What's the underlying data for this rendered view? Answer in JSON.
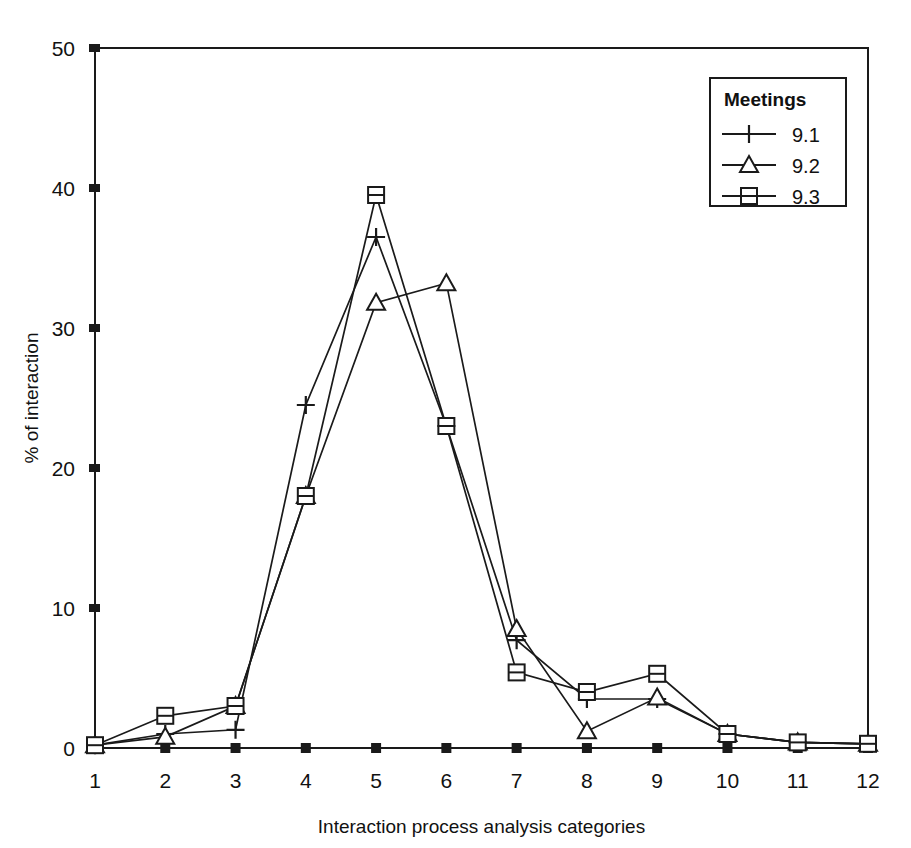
{
  "chart_data": {
    "type": "line",
    "title": "",
    "xlabel": "Interaction process analysis categories",
    "ylabel": "% of interaction",
    "categories": [
      1,
      2,
      3,
      4,
      5,
      6,
      7,
      8,
      9,
      10,
      11,
      12
    ],
    "xtick_labels": [
      "1",
      "2",
      "3",
      "4",
      "5",
      "6",
      "7",
      "8",
      "9",
      "10",
      "11",
      "12"
    ],
    "ytick_labels": [
      "0",
      "10",
      "20",
      "30",
      "40",
      "50"
    ],
    "yticks": [
      0,
      10,
      20,
      30,
      40,
      50
    ],
    "ylim": [
      0,
      50
    ],
    "xlim": [
      1,
      12
    ],
    "grid": false,
    "legend_position": "top-right",
    "legend_title": "Meetings",
    "series": [
      {
        "name": "9.1",
        "marker": "plus",
        "values": [
          0.2,
          1.0,
          1.3,
          24.5,
          36.5,
          23.0,
          7.7,
          3.5,
          3.5,
          1.0,
          0.4,
          0.3
        ]
      },
      {
        "name": "9.2",
        "marker": "triangle",
        "values": [
          0.2,
          0.8,
          3.0,
          18.0,
          31.8,
          33.2,
          8.5,
          1.2,
          3.6,
          1.0,
          0.4,
          0.3
        ]
      },
      {
        "name": "9.3",
        "marker": "square",
        "values": [
          0.2,
          2.3,
          3.0,
          18.0,
          39.5,
          23.0,
          5.4,
          4.0,
          5.3,
          1.0,
          0.4,
          0.3
        ]
      }
    ]
  },
  "axes": {
    "line_color": "#1a1a1a",
    "plot_border": true
  }
}
